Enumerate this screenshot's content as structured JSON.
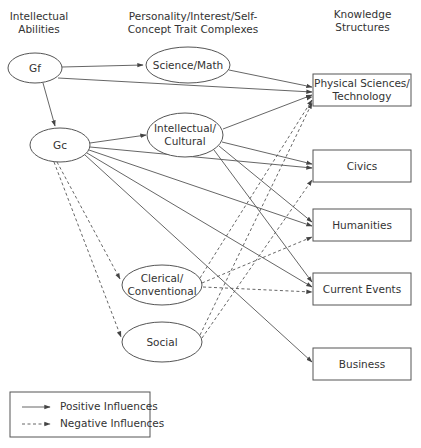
{
  "headers": {
    "abilities": "Intellectual\nAbilities",
    "abilities_l1": "Intellectual",
    "abilities_l2": "Abilities",
    "traits_l1": "Personality/Interest/Self-",
    "traits_l2": "Concept Trait Complexes",
    "knowledge_l1": "Knowledge",
    "knowledge_l2": "Structures"
  },
  "nodes": {
    "gf": {
      "label": "Gf",
      "shape": "ellipse"
    },
    "gc": {
      "label": "Gc",
      "shape": "ellipse"
    },
    "science_math": {
      "label": "Science/Math",
      "shape": "ellipse"
    },
    "intellectual_cultural": {
      "label_l1": "Intellectual/",
      "label_l2": "Cultural",
      "shape": "ellipse"
    },
    "clerical_conventional": {
      "label_l1": "Clerical/",
      "label_l2": "Conventional",
      "shape": "ellipse"
    },
    "social": {
      "label": "Social",
      "shape": "ellipse"
    },
    "physical_sciences": {
      "label_l1": "Physical Sciences/",
      "label_l2": "Technology",
      "shape": "rect"
    },
    "civics": {
      "label": "Civics",
      "shape": "rect"
    },
    "humanities": {
      "label": "Humanities",
      "shape": "rect"
    },
    "current_events": {
      "label": "Current Events",
      "shape": "rect"
    },
    "business": {
      "label": "Business",
      "shape": "rect"
    }
  },
  "edges": [
    {
      "from": "Gf",
      "to": "Science/Math",
      "type": "positive"
    },
    {
      "from": "Gf",
      "to": "Physical Sciences/Technology",
      "type": "positive"
    },
    {
      "from": "Gf",
      "to": "Gc",
      "type": "positive"
    },
    {
      "from": "Gc",
      "to": "Intellectual/Cultural",
      "type": "positive"
    },
    {
      "from": "Gc",
      "to": "Physical Sciences/Technology",
      "type": "positive"
    },
    {
      "from": "Gc",
      "to": "Civics",
      "type": "positive"
    },
    {
      "from": "Gc",
      "to": "Humanities",
      "type": "positive"
    },
    {
      "from": "Gc",
      "to": "Current Events",
      "type": "positive"
    },
    {
      "from": "Gc",
      "to": "Business",
      "type": "positive"
    },
    {
      "from": "Gc",
      "to": "Clerical/Conventional",
      "type": "negative"
    },
    {
      "from": "Gc",
      "to": "Social",
      "type": "negative"
    },
    {
      "from": "Science/Math",
      "to": "Physical Sciences/Technology",
      "type": "positive"
    },
    {
      "from": "Intellectual/Cultural",
      "to": "Physical Sciences/Technology",
      "type": "positive"
    },
    {
      "from": "Intellectual/Cultural",
      "to": "Civics",
      "type": "positive"
    },
    {
      "from": "Intellectual/Cultural",
      "to": "Humanities",
      "type": "positive"
    },
    {
      "from": "Intellectual/Cultural",
      "to": "Current Events",
      "type": "positive"
    },
    {
      "from": "Clerical/Conventional",
      "to": "Physical Sciences/Technology",
      "type": "negative"
    },
    {
      "from": "Clerical/Conventional",
      "to": "Humanities",
      "type": "negative"
    },
    {
      "from": "Clerical/Conventional",
      "to": "Current Events",
      "type": "negative"
    },
    {
      "from": "Social",
      "to": "Physical Sciences/Technology",
      "type": "negative"
    },
    {
      "from": "Social",
      "to": "Civics",
      "type": "negative"
    }
  ],
  "legend": {
    "positive": "Positive Influences",
    "negative": "Negative Influences"
  },
  "colors": {
    "stroke": "#555555",
    "text": "#333333",
    "background": "#ffffff"
  }
}
